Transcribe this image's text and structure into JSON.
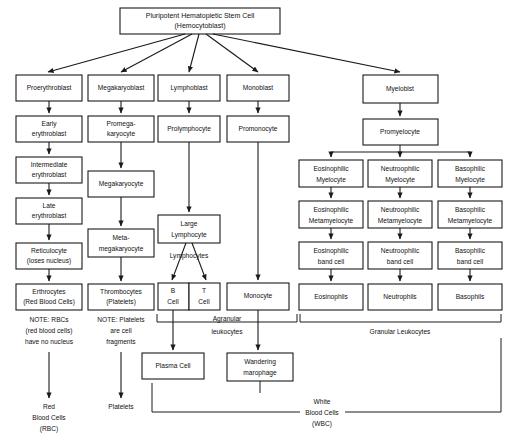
{
  "diagram": {
    "type": "flowchart",
    "root": {
      "line1": "Pluripotent Hematopietic Stem Cell",
      "line2": "(Hemocytoblast)"
    },
    "branches": {
      "erythroid": [
        {
          "id": "proerythroblast",
          "lines": [
            "Proerythroblast"
          ]
        },
        {
          "id": "early-erythroblast",
          "lines": [
            "Early",
            "erythroblast"
          ]
        },
        {
          "id": "intermediate-erythroblast",
          "lines": [
            "Intermediate",
            "erythroblast"
          ]
        },
        {
          "id": "late-erythroblast",
          "lines": [
            "Late",
            "erythroblast"
          ]
        },
        {
          "id": "reticulocyte",
          "lines": [
            "Reticulocyte",
            "(loses nucleus)"
          ]
        },
        {
          "id": "erythrocytes",
          "lines": [
            "Erthrocytes",
            "(Red Blood Cells)"
          ]
        }
      ],
      "megakaryocytic": [
        {
          "id": "megakaryoblast",
          "lines": [
            "Megakaryoblast"
          ]
        },
        {
          "id": "promegakaryocyte",
          "lines": [
            "Promega-",
            "karyocyte"
          ]
        },
        {
          "id": "megakaryocyte",
          "lines": [
            "Megakaryocyte"
          ]
        },
        {
          "id": "metamegakaryocyte",
          "lines": [
            "Meta-",
            "megakaryocyte"
          ]
        },
        {
          "id": "thrombocytes",
          "lines": [
            "Thrombocytes",
            "(Platelets)"
          ]
        }
      ],
      "lymphoid": [
        {
          "id": "lymphoblast",
          "lines": [
            "Lymphoblast"
          ]
        },
        {
          "id": "prolymphocyte",
          "lines": [
            "Prolymphocyte"
          ]
        },
        {
          "id": "large-lymphocyte",
          "lines": [
            "Large",
            "Lymphocyte"
          ]
        },
        {
          "id": "b-cell",
          "lines": [
            "B",
            "Cell"
          ]
        },
        {
          "id": "t-cell",
          "lines": [
            "T",
            "Cell"
          ]
        },
        {
          "id": "plasma-cell",
          "lines": [
            "Plasma Cell"
          ]
        }
      ],
      "monocytic": [
        {
          "id": "monoblast",
          "lines": [
            "Monoblast"
          ]
        },
        {
          "id": "promonocyte",
          "lines": [
            "Promonocyte"
          ]
        },
        {
          "id": "monocyte",
          "lines": [
            "Monocyte"
          ]
        },
        {
          "id": "wandering-macrophage",
          "lines": [
            "Wandering",
            "marophage"
          ]
        }
      ],
      "myeloid": [
        {
          "id": "myeloblast",
          "lines": [
            "Myeloblst"
          ]
        },
        {
          "id": "promyelocyte",
          "lines": [
            "Promyelocyte"
          ]
        }
      ],
      "eosinophil": [
        {
          "id": "eosinophilic-myelocyte",
          "lines": [
            "Eosinophilic",
            "Myelocyte"
          ]
        },
        {
          "id": "eosinophilic-metamyelocyte",
          "lines": [
            "Eosinophilic",
            "Metamyelocyte"
          ]
        },
        {
          "id": "eosinophilic-band-cell",
          "lines": [
            "Eosinophilic",
            "band cell"
          ]
        },
        {
          "id": "eosinophils",
          "lines": [
            "Eosinophils"
          ]
        }
      ],
      "neutrophil": [
        {
          "id": "neutrophilic-myelocyte",
          "lines": [
            "Neutroophilic",
            "Myelocyte"
          ]
        },
        {
          "id": "neutrophilic-metamyelocyte",
          "lines": [
            "Neutroophilic",
            "Metamyelocyte"
          ]
        },
        {
          "id": "neutrophilic-band-cell",
          "lines": [
            "Neutroophilic",
            "band cell"
          ]
        },
        {
          "id": "neutrophils",
          "lines": [
            "Neutrophils"
          ]
        }
      ],
      "basophil": [
        {
          "id": "basophilic-myelocyte",
          "lines": [
            "Basophilic",
            "Myelocyte"
          ]
        },
        {
          "id": "basophilic-metamyelocyte",
          "lines": [
            "Basophilic",
            "Metamyelocyte"
          ]
        },
        {
          "id": "basophilic-band-cell",
          "lines": [
            "Basophilic",
            "band cell"
          ]
        },
        {
          "id": "basophils",
          "lines": [
            "Basophils"
          ]
        }
      ]
    },
    "notes": {
      "rbc_note": [
        "NOTE: RBCs",
        "(red blood cells)",
        "have no nucleus"
      ],
      "platelet_note": [
        "NOTE: Platelets",
        "are cell",
        "fragments"
      ]
    },
    "labels": {
      "lymphocytes": "Lymphocytes",
      "agranular_leukocytes": [
        "Agranular",
        "leukocytes"
      ],
      "granular_leukocytes": "Granular Leukocytes",
      "red_blood_cells": [
        "Red",
        "Blood Cells",
        "(RBC)"
      ],
      "platelets": "Platelets",
      "white_blood_cells": [
        "White",
        "Blood Cells",
        "(WBC)"
      ]
    },
    "colors": {
      "stroke": "#1a1a1a",
      "box_fill": "#ffffff",
      "background": "#ffffff"
    }
  }
}
